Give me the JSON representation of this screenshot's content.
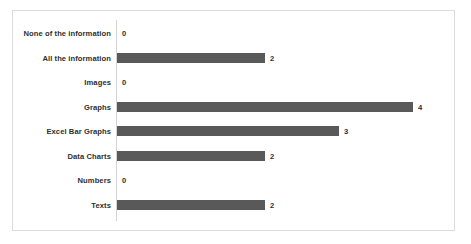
{
  "chart_data": {
    "type": "bar",
    "orientation": "horizontal",
    "title": "",
    "subtitle": "",
    "xlabel": "",
    "ylabel": "",
    "grid": false,
    "legend": false,
    "legend_position": "none",
    "axis_line": "vertical-category-axis",
    "xlim": [
      0,
      4
    ],
    "categories": [
      "None of the information",
      "All the information",
      "Images",
      "Graphs",
      "Excel Bar Graphs",
      "Data Charts",
      "Numbers",
      "Texts"
    ],
    "values": [
      0,
      2,
      0,
      4,
      3,
      2,
      0,
      2
    ],
    "value_labels": [
      "0",
      "2",
      "0",
      "4",
      "3",
      "2",
      "0",
      "2"
    ],
    "bar_color": "#595959",
    "axis_color": "#d4d4d4",
    "border_color": "#dcdcdc",
    "background_color": "#ffffff",
    "text_color": "#2f2f2f"
  }
}
